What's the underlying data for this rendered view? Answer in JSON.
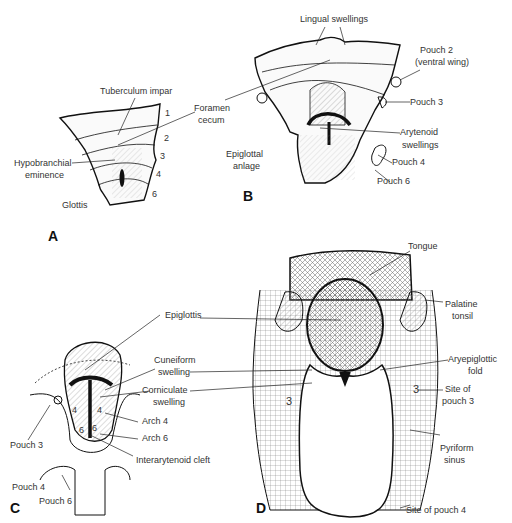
{
  "figure": {
    "panels": {
      "A": {
        "letter": "A",
        "labels": {
          "tuberculum_impar": "Tuberculum impar",
          "hypobranchial_1": "Hypobranchial",
          "hypobranchial_2": "eminence",
          "glottis": "Glottis"
        },
        "arch_numbers": [
          "1",
          "2",
          "3",
          "4",
          "6"
        ]
      },
      "B": {
        "letter": "B",
        "labels": {
          "lingual_swellings": "Lingual swellings",
          "foramen_1": "Foramen",
          "foramen_2": "cecum",
          "pouch2_1": "Pouch 2",
          "pouch2_2": "(ventral wing)",
          "pouch3": "Pouch 3",
          "arytenoid_1": "Arytenoid",
          "arytenoid_2": "swellings",
          "epiglottal_1": "Epiglottal",
          "epiglottal_2": "anlage",
          "pouch4": "Pouch 4",
          "pouch6": "Pouch 6"
        }
      },
      "C": {
        "letter": "C",
        "labels": {
          "epiglottis": "Epiglottis",
          "cuneiform_1": "Cuneiform",
          "cuneiform_2": "swelling",
          "corniculate_1": "Corniculate",
          "corniculate_2": "swelling",
          "arch4": "Arch 4",
          "arch6": "Arch 6",
          "interarytenoid": "Interarytenoid cleft",
          "pouch3": "Pouch 3",
          "pouch4": "Pouch 4",
          "pouch6": "Pouch 6"
        },
        "arch_numbers": [
          "4",
          "4",
          "6",
          "6"
        ]
      },
      "D": {
        "letter": "D",
        "labels": {
          "tongue": "Tongue",
          "palatine_1": "Palatine",
          "palatine_2": "tonsil",
          "aryepiglottic_1": "Aryepiglottic",
          "aryepiglottic_2": "fold",
          "site3_1": "Site of",
          "site3_2": "pouch 3",
          "pyriform_1": "Pyriform",
          "pyriform_2": "sinus",
          "site4": "Site of pouch 4"
        },
        "arch_numbers": [
          "3",
          "3"
        ]
      }
    }
  }
}
